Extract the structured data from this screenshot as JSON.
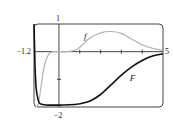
{
  "chart_data": {
    "type": "line",
    "title": "",
    "xlabel": "",
    "ylabel": "",
    "xlim": [
      -1.2,
      5
    ],
    "ylim": [
      -2,
      1
    ],
    "grid": false,
    "legend": "inline labels",
    "tick_labels": {
      "x_left": "−1.2",
      "x_right": "5",
      "y_top": "1",
      "y_bottom": "−2"
    },
    "x_ticks": [
      1,
      2,
      3,
      4
    ],
    "y_ticks": [
      -1
    ],
    "series": [
      {
        "name": "f",
        "color": "#b3b3b3",
        "x": [
          -1.2,
          -1.0,
          -0.85,
          -0.7,
          -0.5,
          -0.3,
          0,
          0.3,
          0.6,
          0.9,
          1.2,
          1.5,
          2.0,
          2.5,
          3.0,
          3.5,
          4.0,
          4.5,
          5.0
        ],
        "y": [
          -2.0,
          -1.9,
          -1.2,
          -0.5,
          -0.1,
          0.0,
          0.0,
          0.0,
          0.02,
          0.1,
          0.3,
          0.5,
          0.68,
          0.73,
          0.66,
          0.45,
          0.25,
          0.12,
          0.05
        ]
      },
      {
        "name": "F",
        "color": "#111111",
        "x": [
          -1.2,
          -1.15,
          -1.1,
          -1.0,
          -0.9,
          -0.7,
          -0.5,
          0,
          0.5,
          1.0,
          1.5,
          2.0,
          2.5,
          3.0,
          3.5,
          4.0,
          4.5,
          5.0
        ],
        "y": [
          1.0,
          -0.5,
          -1.3,
          -1.75,
          -1.88,
          -1.92,
          -1.93,
          -1.93,
          -1.92,
          -1.88,
          -1.78,
          -1.55,
          -1.2,
          -0.85,
          -0.55,
          -0.32,
          -0.16,
          -0.08
        ]
      }
    ],
    "annotations": [
      {
        "text": "f",
        "x": 1.2,
        "y": 0.45
      },
      {
        "text": "F",
        "x": 3.4,
        "y": -1.05
      }
    ]
  }
}
